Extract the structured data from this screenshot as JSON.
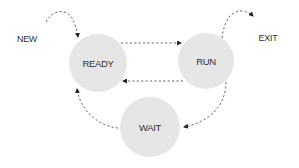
{
  "diagram": {
    "states": [
      {
        "id": "ready",
        "label": "READY",
        "cx": 98,
        "cy": 63,
        "r": 29
      },
      {
        "id": "run",
        "label": "RUN",
        "cx": 206,
        "cy": 61,
        "r": 28
      },
      {
        "id": "wait",
        "label": "WAIT",
        "cx": 150,
        "cy": 127,
        "r": 30
      }
    ],
    "external": {
      "new": {
        "label": "NEW"
      },
      "exit": {
        "label": "EXIT"
      }
    },
    "transitions": [
      {
        "from": "NEW",
        "to": "READY"
      },
      {
        "from": "READY",
        "to": "RUN"
      },
      {
        "from": "RUN",
        "to": "READY"
      },
      {
        "from": "RUN",
        "to": "WAIT"
      },
      {
        "from": "WAIT",
        "to": "READY"
      },
      {
        "from": "RUN",
        "to": "EXIT"
      }
    ],
    "colors": {
      "node_fill": "#e6e6e6",
      "arrow": "#666666",
      "text": "#333333"
    }
  }
}
